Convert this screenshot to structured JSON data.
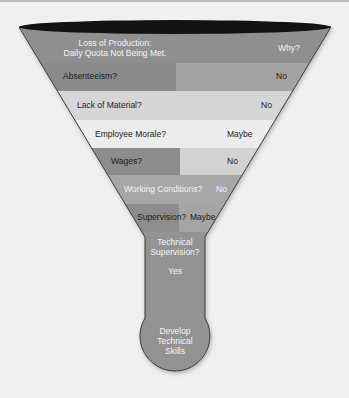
{
  "diagram": {
    "title_line1": "Loss of Production:",
    "title_line2": "Daily Quota Not Being Met.",
    "title_answer": "Why?",
    "rows": [
      {
        "question": "Absenteeism?",
        "answer": "No"
      },
      {
        "question": "Lack of Material?",
        "answer": "No"
      },
      {
        "question": "Employee Morale?",
        "answer": "Maybe"
      },
      {
        "question": "Wages?",
        "answer": "No"
      },
      {
        "question": "Working Conditions?",
        "answer": "No"
      },
      {
        "question": "Supervision?",
        "answer": "Maybe"
      }
    ],
    "neck_line1": "Technical",
    "neck_line2": "Supervision?",
    "neck_answer": "Yes",
    "outcome_line1": "Develop",
    "outcome_line2": "Technical",
    "outcome_line3": "Skills",
    "colors": {
      "dark_band": "#8a8a8a",
      "mid_band": "#a9a9a9",
      "light_band": "#d8d8d8",
      "lighter_band": "#ececec",
      "rim": "#111111"
    }
  }
}
